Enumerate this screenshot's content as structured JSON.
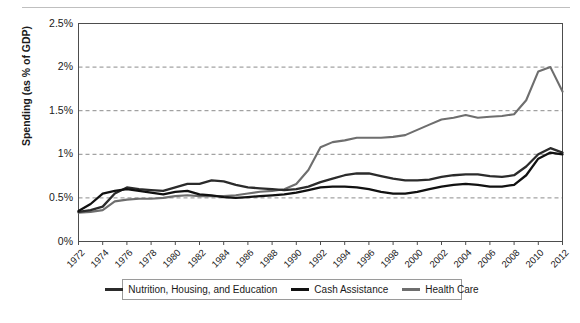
{
  "chart_data": {
    "type": "line",
    "title": "",
    "subtitle": "",
    "xlabel": "",
    "ylabel": "Spending (as % of GDP)",
    "grid": true,
    "legend_position": "bottom",
    "xlim": [
      1972,
      2012
    ],
    "ylim": [
      0,
      2.5
    ],
    "ytick_labels": [
      "0%",
      "0.5%",
      "1%",
      "1.5%",
      "2%",
      "2.5%"
    ],
    "ytick_values": [
      0,
      0.5,
      1,
      1.5,
      2,
      2.5
    ],
    "xtick_labels": [
      "1972",
      "1974",
      "1976",
      "1978",
      "1980",
      "1982",
      "1984",
      "1986",
      "1988",
      "1990",
      "1992",
      "1994",
      "1996",
      "1998",
      "2000",
      "2002",
      "2004",
      "2006",
      "2008",
      "2010",
      "2012"
    ],
    "x": [
      1972,
      1973,
      1974,
      1975,
      1976,
      1977,
      1978,
      1979,
      1980,
      1981,
      1982,
      1983,
      1984,
      1985,
      1986,
      1987,
      1988,
      1989,
      1990,
      1991,
      1992,
      1993,
      1994,
      1995,
      1996,
      1997,
      1998,
      1999,
      2000,
      2001,
      2002,
      2003,
      2004,
      2005,
      2006,
      2007,
      2008,
      2009,
      2010,
      2011,
      2012
    ],
    "series": [
      {
        "name": "Nutrition, Housing, and Education",
        "color": "#2b2b2b",
        "values": [
          0.34,
          0.36,
          0.4,
          0.55,
          0.62,
          0.6,
          0.59,
          0.58,
          0.62,
          0.66,
          0.66,
          0.7,
          0.69,
          0.65,
          0.62,
          0.61,
          0.6,
          0.59,
          0.6,
          0.63,
          0.68,
          0.72,
          0.76,
          0.78,
          0.78,
          0.75,
          0.72,
          0.7,
          0.7,
          0.71,
          0.74,
          0.76,
          0.77,
          0.77,
          0.75,
          0.74,
          0.76,
          0.86,
          1.0,
          1.07,
          1.02
        ]
      },
      {
        "name": "Cash Assistance",
        "color": "#111111",
        "values": [
          0.35,
          0.43,
          0.55,
          0.58,
          0.6,
          0.58,
          0.56,
          0.54,
          0.57,
          0.58,
          0.54,
          0.53,
          0.51,
          0.5,
          0.51,
          0.52,
          0.53,
          0.54,
          0.56,
          0.59,
          0.62,
          0.63,
          0.63,
          0.62,
          0.6,
          0.57,
          0.55,
          0.55,
          0.57,
          0.6,
          0.63,
          0.65,
          0.66,
          0.65,
          0.63,
          0.63,
          0.65,
          0.76,
          0.95,
          1.02,
          1.0
        ]
      },
      {
        "name": "Health Care",
        "color": "#6e6e6e",
        "values": [
          0.33,
          0.34,
          0.36,
          0.46,
          0.48,
          0.49,
          0.49,
          0.5,
          0.52,
          0.53,
          0.52,
          0.52,
          0.52,
          0.53,
          0.55,
          0.57,
          0.58,
          0.6,
          0.66,
          0.82,
          1.08,
          1.14,
          1.16,
          1.19,
          1.19,
          1.19,
          1.2,
          1.22,
          1.28,
          1.34,
          1.4,
          1.42,
          1.45,
          1.42,
          1.43,
          1.44,
          1.46,
          1.62,
          1.95,
          2.0,
          1.72
        ]
      }
    ]
  },
  "legend": {
    "items": [
      {
        "label": "Nutrition, Housing, and Education",
        "color": "#2b2b2b"
      },
      {
        "label": "Cash Assistance",
        "color": "#111111"
      },
      {
        "label": "Health Care",
        "color": "#6e6e6e"
      }
    ]
  }
}
